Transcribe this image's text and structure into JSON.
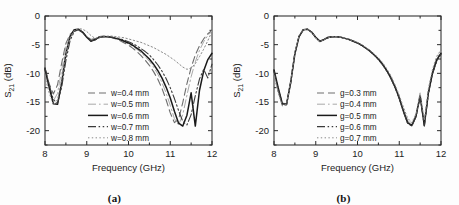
{
  "figure": {
    "background": "#fdfdfd",
    "panels": [
      {
        "id": "a",
        "caption": "(a)",
        "xlabel": "Frequency (GHz)",
        "ylabel_main": "S",
        "ylabel_sub": "21",
        "ylabel_unit": " (dB)",
        "xticks": [
          "8",
          "9",
          "10",
          "11",
          "12"
        ],
        "yticks": [
          "0",
          "-5",
          "-10",
          "-15",
          "-20"
        ]
      },
      {
        "id": "b",
        "caption": "(b)",
        "xlabel": "Frequency (GHz)",
        "ylabel_main": "S",
        "ylabel_sub": "21",
        "ylabel_unit": " (dB)",
        "xticks": [
          "8",
          "9",
          "10",
          "11",
          "12"
        ],
        "yticks": [
          "0",
          "-5",
          "-10",
          "-15",
          "-20"
        ]
      }
    ]
  },
  "chart_data": [
    {
      "type": "line",
      "panel": "a",
      "title": "",
      "xlabel": "Frequency (GHz)",
      "ylabel": "S21 (dB)",
      "xlim": [
        8,
        12
      ],
      "ylim": [
        -22.5,
        0
      ],
      "xticks": [
        8,
        9,
        10,
        11,
        12
      ],
      "yticks": [
        0,
        -5,
        -10,
        -15,
        -20
      ],
      "grid": false,
      "legend_position": "center-left-inside",
      "x": [
        8.0,
        8.1,
        8.2,
        8.3,
        8.4,
        8.5,
        8.6,
        8.7,
        8.8,
        8.9,
        9.0,
        9.1,
        9.2,
        9.3,
        9.4,
        9.5,
        9.6,
        9.7,
        9.8,
        9.9,
        10.0,
        10.1,
        10.2,
        10.3,
        10.4,
        10.5,
        10.6,
        10.7,
        10.8,
        10.9,
        11.0,
        11.1,
        11.2,
        11.3,
        11.4,
        11.5,
        11.6,
        11.7,
        11.8,
        11.9,
        12.0
      ],
      "series": [
        {
          "name": "w=0.4 mm",
          "style": "dashed",
          "color": "#6e6e6e",
          "values": [
            -9.4,
            -11.8,
            -13.6,
            -12.0,
            -8.2,
            -4.8,
            -3.2,
            -2.6,
            -2.5,
            -2.9,
            -3.6,
            -4.1,
            -3.9,
            -3.6,
            -3.5,
            -3.6,
            -3.8,
            -4.0,
            -4.3,
            -4.7,
            -5.1,
            -5.6,
            -6.2,
            -6.9,
            -7.7,
            -8.6,
            -9.7,
            -11.0,
            -12.6,
            -14.6,
            -16.9,
            -18.6,
            -18.0,
            -15.1,
            -11.8,
            -9.0,
            -6.8,
            -5.2,
            -4.0,
            -3.1,
            -2.5
          ]
        },
        {
          "name": "w=0.5 mm",
          "style": "dashdot",
          "color": "#a8a8a8",
          "values": [
            -9.8,
            -12.6,
            -14.8,
            -13.5,
            -9.4,
            -5.4,
            -3.3,
            -2.5,
            -2.4,
            -2.9,
            -3.7,
            -4.2,
            -4.0,
            -3.7,
            -3.5,
            -3.6,
            -3.7,
            -3.9,
            -4.2,
            -4.5,
            -4.9,
            -5.3,
            -5.8,
            -6.4,
            -7.1,
            -7.9,
            -8.9,
            -10.1,
            -11.6,
            -13.4,
            -15.6,
            -17.9,
            -19.0,
            -17.2,
            -13.8,
            -10.6,
            -8.0,
            -6.0,
            -4.5,
            -3.4,
            -2.6
          ]
        },
        {
          "name": "w=0.6 mm",
          "style": "solid",
          "color": "#1a1a1a",
          "values": [
            -9.2,
            -12.4,
            -15.3,
            -15.4,
            -11.6,
            -6.6,
            -3.6,
            -2.4,
            -2.3,
            -2.8,
            -3.7,
            -4.4,
            -4.1,
            -3.7,
            -3.6,
            -3.6,
            -3.7,
            -3.9,
            -4.1,
            -4.4,
            -4.7,
            -5.1,
            -5.6,
            -6.1,
            -6.8,
            -7.5,
            -8.4,
            -9.5,
            -10.8,
            -12.4,
            -14.3,
            -16.6,
            -18.7,
            -19.2,
            -17.3,
            -13.4,
            -19.2,
            -13.0,
            -9.6,
            -7.6,
            -6.5
          ]
        },
        {
          "name": "w=0.7 mm",
          "style": "dashdotdot",
          "color": "#3a3a3a",
          "values": [
            -9.0,
            -12.0,
            -14.6,
            -15.2,
            -12.4,
            -7.8,
            -4.3,
            -2.7,
            -2.4,
            -2.8,
            -3.6,
            -4.3,
            -4.2,
            -3.8,
            -3.6,
            -3.6,
            -3.7,
            -3.8,
            -4.0,
            -4.2,
            -4.5,
            -4.8,
            -5.2,
            -5.7,
            -6.2,
            -6.8,
            -7.6,
            -8.5,
            -9.6,
            -10.9,
            -12.5,
            -14.4,
            -16.5,
            -18.4,
            -19.0,
            -17.2,
            -13.9,
            -11.0,
            -9.3,
            -10.8,
            -8.4
          ]
        },
        {
          "name": "w=0.8 mm",
          "style": "dotted",
          "color": "#8a8a8a",
          "values": [
            -10.6,
            -13.4,
            -15.5,
            -14.6,
            -11.0,
            -6.6,
            -3.8,
            -2.5,
            -2.2,
            -2.3,
            -2.7,
            -3.4,
            -3.9,
            -3.7,
            -3.5,
            -3.5,
            -3.5,
            -3.6,
            -3.7,
            -3.8,
            -4.0,
            -4.2,
            -4.4,
            -4.6,
            -4.9,
            -5.2,
            -5.5,
            -5.9,
            -6.3,
            -6.7,
            -7.2,
            -7.7,
            -8.3,
            -8.9,
            -9.3,
            -9.1,
            -8.3,
            -7.1,
            -5.8,
            -4.3,
            -2.7
          ]
        }
      ]
    },
    {
      "type": "line",
      "panel": "b",
      "title": "",
      "xlabel": "Frequency (GHz)",
      "ylabel": "S21 (dB)",
      "xlim": [
        8,
        12
      ],
      "ylim": [
        -22.5,
        0
      ],
      "xticks": [
        8,
        9,
        10,
        11,
        12
      ],
      "yticks": [
        0,
        -5,
        -10,
        -15,
        -20
      ],
      "grid": false,
      "legend_position": "center-left-inside",
      "x": [
        8.0,
        8.1,
        8.2,
        8.3,
        8.4,
        8.5,
        8.6,
        8.7,
        8.8,
        8.9,
        9.0,
        9.1,
        9.2,
        9.3,
        9.4,
        9.5,
        9.6,
        9.7,
        9.8,
        9.9,
        10.0,
        10.1,
        10.2,
        10.3,
        10.4,
        10.5,
        10.6,
        10.7,
        10.8,
        10.9,
        11.0,
        11.1,
        11.2,
        11.3,
        11.4,
        11.5,
        11.6,
        11.7,
        11.8,
        11.9,
        12.0
      ],
      "series": [
        {
          "name": "g=0.3 mm",
          "style": "dashed",
          "color": "#6e6e6e",
          "values": [
            -9.8,
            -12.8,
            -15.2,
            -15.3,
            -11.4,
            -6.4,
            -3.5,
            -2.4,
            -2.3,
            -2.8,
            -3.8,
            -4.5,
            -4.1,
            -3.8,
            -3.6,
            -3.6,
            -3.7,
            -3.9,
            -4.1,
            -4.4,
            -4.7,
            -5.1,
            -5.6,
            -6.1,
            -6.8,
            -7.5,
            -8.4,
            -9.5,
            -10.8,
            -12.4,
            -14.3,
            -16.5,
            -18.4,
            -19.0,
            -17.6,
            -14.0,
            -18.9,
            -13.4,
            -10.0,
            -7.8,
            -6.6
          ]
        },
        {
          "name": "g=0.4 mm",
          "style": "dashdot",
          "color": "#a8a8a8",
          "values": [
            -10.1,
            -13.1,
            -15.4,
            -15.2,
            -11.2,
            -6.3,
            -3.5,
            -2.4,
            -2.3,
            -2.8,
            -3.8,
            -4.5,
            -4.1,
            -3.8,
            -3.6,
            -3.6,
            -3.7,
            -3.9,
            -4.1,
            -4.4,
            -4.7,
            -5.1,
            -5.6,
            -6.1,
            -6.8,
            -7.5,
            -8.3,
            -9.4,
            -10.7,
            -12.3,
            -14.1,
            -16.3,
            -18.2,
            -18.9,
            -17.4,
            -13.8,
            -18.6,
            -13.0,
            -9.6,
            -7.4,
            -6.2
          ]
        },
        {
          "name": "g=0.5 mm",
          "style": "solid",
          "color": "#1a1a1a",
          "values": [
            -9.4,
            -12.5,
            -15.3,
            -15.4,
            -11.6,
            -6.6,
            -3.6,
            -2.4,
            -2.3,
            -2.8,
            -3.7,
            -4.4,
            -4.1,
            -3.7,
            -3.6,
            -3.6,
            -3.7,
            -3.9,
            -4.1,
            -4.4,
            -4.7,
            -5.1,
            -5.6,
            -6.1,
            -6.8,
            -7.5,
            -8.4,
            -9.5,
            -10.8,
            -12.4,
            -14.3,
            -16.6,
            -18.6,
            -19.1,
            -17.5,
            -13.9,
            -19.1,
            -13.3,
            -9.8,
            -7.6,
            -6.5
          ]
        },
        {
          "name": "g=0.6 mm",
          "style": "dashdotdot",
          "color": "#3a3a3a",
          "values": [
            -9.6,
            -12.7,
            -15.5,
            -15.5,
            -11.7,
            -6.6,
            -3.6,
            -2.4,
            -2.3,
            -2.8,
            -3.8,
            -4.4,
            -4.1,
            -3.8,
            -3.6,
            -3.6,
            -3.7,
            -3.9,
            -4.1,
            -4.4,
            -4.7,
            -5.1,
            -5.6,
            -6.2,
            -6.8,
            -7.6,
            -8.5,
            -9.6,
            -10.9,
            -12.5,
            -14.4,
            -16.7,
            -18.7,
            -19.2,
            -17.6,
            -14.0,
            -19.2,
            -13.5,
            -10.0,
            -7.8,
            -6.7
          ]
        },
        {
          "name": "g=0.7 mm",
          "style": "dotted",
          "color": "#8a8a8a",
          "values": [
            -10.4,
            -13.4,
            -15.7,
            -15.4,
            -11.3,
            -6.3,
            -3.4,
            -2.4,
            -2.3,
            -2.8,
            -3.8,
            -4.5,
            -4.1,
            -3.8,
            -3.6,
            -3.6,
            -3.7,
            -3.9,
            -4.1,
            -4.3,
            -4.6,
            -5.0,
            -5.5,
            -6.0,
            -6.6,
            -7.3,
            -8.1,
            -9.2,
            -10.4,
            -12.0,
            -13.8,
            -15.9,
            -17.8,
            -18.6,
            -17.1,
            -13.4,
            -18.2,
            -12.6,
            -9.2,
            -7.0,
            -5.9
          ]
        }
      ]
    }
  ]
}
